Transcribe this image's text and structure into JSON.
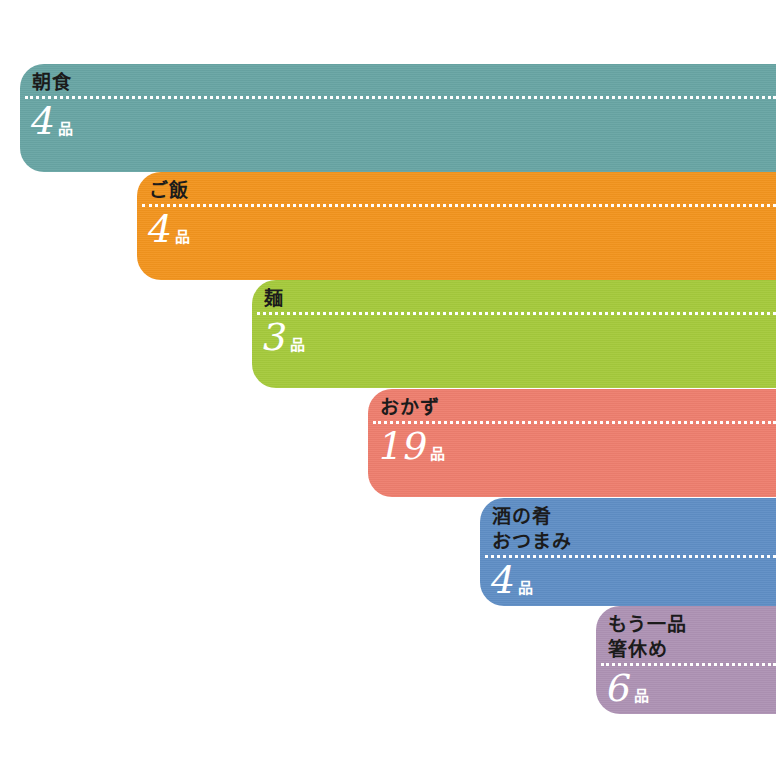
{
  "page": {
    "background_color": "#ffffff",
    "description_labels": {
      "unit_suffix": "品"
    }
  },
  "bars": [
    {
      "name": "breakfast",
      "title_line1": "朝食",
      "title_line2": "",
      "count": "4",
      "unit": "品",
      "color": "#68a5a4"
    },
    {
      "name": "rice",
      "title_line1": "ご飯",
      "title_line2": "",
      "count": "4",
      "unit": "品",
      "color": "#f2941e"
    },
    {
      "name": "noodles",
      "title_line1": "麺",
      "title_line2": "",
      "count": "3",
      "unit": "品",
      "color": "#a5ca3c"
    },
    {
      "name": "side-dishes",
      "title_line1": "おかず",
      "title_line2": "",
      "count": "19",
      "unit": "品",
      "color": "#ee7e6e"
    },
    {
      "name": "sake-snacks",
      "title_line1": "酒の肴",
      "title_line2": "おつまみ",
      "count": "4",
      "unit": "品",
      "color": "#5f8ec5"
    },
    {
      "name": "one-more-dish",
      "title_line1": "もう一品",
      "title_line2": "箸休め",
      "count": "6",
      "unit": "品",
      "color": "#ae92b4"
    }
  ]
}
